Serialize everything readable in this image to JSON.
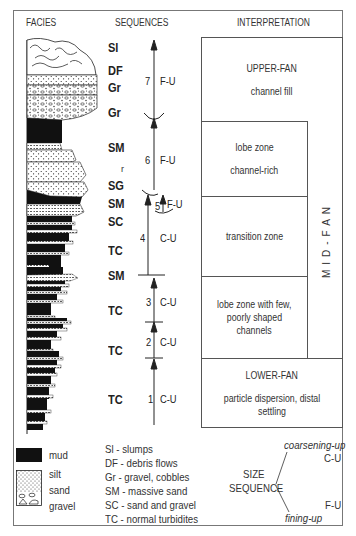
{
  "headers": {
    "facies": "FACIES",
    "sequences": "SEQUENCES",
    "interpretation": "INTERPRETATION"
  },
  "facies_codes": [
    {
      "code": "Sl",
      "y": 40
    },
    {
      "code": "DF",
      "y": 63
    },
    {
      "code": "Gr",
      "y": 80
    },
    {
      "code": "Gr",
      "y": 105
    },
    {
      "code": "SM",
      "y": 140
    },
    {
      "code": "SG",
      "y": 178
    },
    {
      "code": "SM",
      "y": 196
    },
    {
      "code": "SC",
      "y": 214
    },
    {
      "code": "TC",
      "y": 243
    },
    {
      "code": "SM",
      "y": 268
    },
    {
      "code": "TC",
      "y": 303
    },
    {
      "code": "TC",
      "y": 343
    },
    {
      "code": "TC",
      "y": 392
    }
  ],
  "small_r": "r",
  "sequences": [
    {
      "num": "7",
      "type": "F-U"
    },
    {
      "num": "6",
      "type": "F-U"
    },
    {
      "num": "5",
      "type": "F-U"
    },
    {
      "num": "4",
      "type": "C-U"
    },
    {
      "num": "3",
      "type": "C-U"
    },
    {
      "num": "2",
      "type": "C-U"
    },
    {
      "num": "1",
      "type": "C-U"
    }
  ],
  "interpretation": {
    "upper_fan": {
      "title": "UPPER-FAN",
      "sub": "channel fill"
    },
    "lobe_rich": {
      "line1": "lobe zone",
      "line2": "channel-rich"
    },
    "transition": {
      "text": "transition zone"
    },
    "lobe_few": {
      "line1": "lobe zone with few,",
      "line2": "poorly shaped",
      "line3": "channels"
    },
    "lower_fan": {
      "title": "LOWER-FAN",
      "sub": "particle dispersion, distal settling"
    },
    "mid_fan": "MID-FAN"
  },
  "legend": {
    "lithology": [
      "mud",
      "silt",
      "sand",
      "gravel"
    ],
    "codes": [
      "Sl - slumps",
      "DF - debris flows",
      "Gr - gravel, cobbles",
      "SM - massive sand",
      "SC - sand and gravel",
      "TC - normal turbidites"
    ],
    "size_sequence": {
      "label1": "SIZE",
      "label2": "SEQUENCE",
      "coarsening": "coarsening-up",
      "cu": "C-U",
      "fining": "fining-up",
      "fu": "F-U"
    }
  }
}
